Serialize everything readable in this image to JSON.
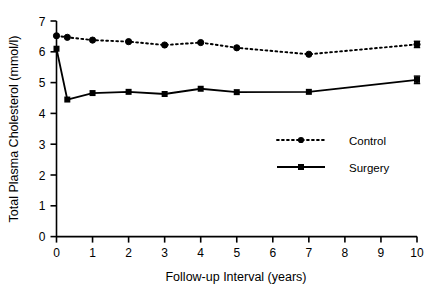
{
  "chart_data": {
    "type": "line",
    "title": "",
    "subtitle": "",
    "xlabel": "Follow-up Interval (years)",
    "ylabel": "Total Plasma Cholesterol (mmol/l)",
    "xlim": [
      0,
      10
    ],
    "ylim": [
      0,
      7
    ],
    "xticks": [
      0,
      1,
      2,
      3,
      4,
      5,
      6,
      7,
      8,
      9,
      10
    ],
    "xtick_labels": [
      "0",
      "1",
      "2",
      "3",
      "4",
      "5",
      "6",
      "7",
      "8",
      "9",
      "10"
    ],
    "yticks": [
      0,
      1,
      2,
      3,
      4,
      5,
      6,
      7
    ],
    "ytick_labels": [
      "0",
      "1",
      "2",
      "3",
      "4",
      "5",
      "6",
      "7"
    ],
    "grid": false,
    "legend_position": "center-right",
    "x": [
      0,
      0.3,
      1,
      2,
      3,
      4,
      5,
      7,
      10
    ],
    "series": [
      {
        "name": "Control",
        "line_style": "dotted",
        "marker": "circle",
        "color": "#000000",
        "values": [
          6.52,
          6.47,
          6.38,
          6.33,
          6.22,
          6.3,
          6.13,
          5.92,
          6.24
        ],
        "errors": [
          0.0,
          0.0,
          0.0,
          0.0,
          0.0,
          0.0,
          0.0,
          0.0,
          0.1
        ]
      },
      {
        "name": "Surgery",
        "line_style": "solid",
        "marker": "square",
        "color": "#000000",
        "values": [
          6.1,
          4.45,
          4.66,
          4.7,
          4.63,
          4.8,
          4.69,
          4.7,
          5.09
        ],
        "errors": [
          0.0,
          0.0,
          0.0,
          0.0,
          0.0,
          0.0,
          0.0,
          0.0,
          0.12
        ]
      }
    ],
    "legend": [
      {
        "label": "Control",
        "marker": "circle",
        "line_style": "dotted"
      },
      {
        "label": "Surgery",
        "marker": "square",
        "line_style": "solid"
      }
    ]
  }
}
